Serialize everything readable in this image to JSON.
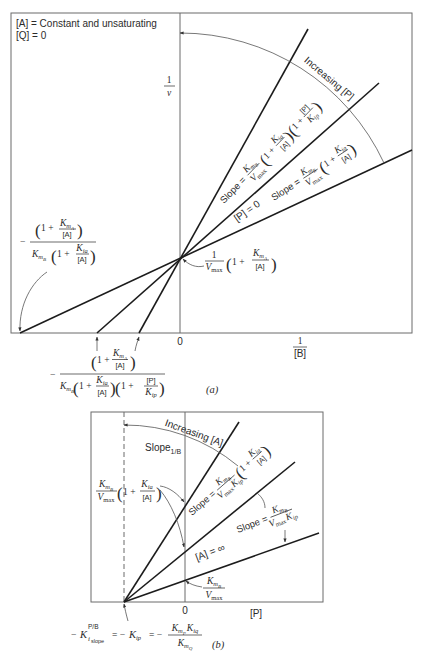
{
  "math_tokens": {
    "lp": "(",
    "rp": ")",
    "one_plus": "1 +",
    "minus": "−",
    "eq_minus": "= −",
    "K": "K",
    "V": "V",
    "m": "m",
    "max": "max",
    "A": "A",
    "B": "B",
    "P": "P",
    "Q": "Q",
    "ia": "ia",
    "ip": "ip",
    "iq": "iq",
    "conc_A": "[A]",
    "conc_P": "[P]",
    "one": "1",
    "slope_eq": "Slope ="
  },
  "panel_a": {
    "tag": "(a)",
    "conditions": [
      "[A] = Constant and unsaturating",
      "[Q] = 0"
    ],
    "y_axis": {
      "num": "1",
      "den": "v"
    },
    "x_axis": {
      "num": "1",
      "den": "[B]",
      "origin": "0"
    },
    "arc_label": "Increasing [P]",
    "line_label": "[P] = 0"
  },
  "panel_b": {
    "tag": "(b)",
    "x_axis": {
      "label": "[P]",
      "origin": "0"
    },
    "arc_label": "Increasing [A]",
    "slope_label": {
      "word": "Slope",
      "sub": "1/B"
    },
    "line_label": "[A] = ∞",
    "ki_formula": {
      "sup": "P/B",
      "sub": "i",
      "subsub": "slope"
    }
  },
  "chart_data": [
    {
      "panel": "(a)",
      "type": "line",
      "title": "",
      "xlabel": "1/[B]",
      "ylabel": "1/v",
      "xlim": [
        -1.69,
        2.32
      ],
      "ylim": [
        0,
        3.2
      ],
      "grid": false,
      "legend": null,
      "conditions": [
        "[A] = Constant and unsaturating",
        "[Q] = 0"
      ],
      "series": [
        {
          "name": "[P] = 0",
          "slope_label": "Slope = (K_mB/Vmax)(1 + K_ia/[A])",
          "points": [
            [
              -1.6,
              0
            ],
            [
              0,
              0.75
            ],
            [
              2.32,
              1.83
            ]
          ]
        },
        {
          "name": "",
          "slope_label": "Slope = (K_mB/Vmax)(1 + K_ia/[A])(1 + [P]/K_ip)",
          "points": [
            [
              -0.83,
              0
            ],
            [
              0,
              0.75
            ],
            [
              1.99,
              2.5
            ]
          ]
        },
        {
          "name": "",
          "slope_label": "",
          "points": [
            [
              -0.41,
              0
            ],
            [
              0,
              0.75
            ],
            [
              1.28,
              3.04
            ]
          ]
        }
      ],
      "annotations": [
        {
          "text": "Increasing [P]",
          "kind": "arc arrow across lines"
        },
        {
          "text": "1/Vmax (1 + K_mA/[A])",
          "at": "common y-intercept"
        },
        {
          "text": "−(1 + K_mA/[A]) / [K_mB (1 + K_ia/[A])]",
          "at": "x-intercept of [P] = 0 line"
        },
        {
          "text": "−(1 + K_mA/[A]) / [K_mB (1 + K_ia/[A])(1 + [P]/K_ip)]",
          "at": "x-intercepts of other lines"
        },
        {
          "text": "0",
          "at": "origin"
        }
      ]
    },
    {
      "panel": "(b)",
      "type": "line",
      "title": "",
      "xlabel": "[P]",
      "ylabel": "Slope_1/B",
      "xlim": [
        -0.94,
        1.38
      ],
      "ylim": [
        0,
        1.9
      ],
      "grid": false,
      "legend": null,
      "series": [
        {
          "name": "[A] = ∞",
          "slope_label": "Slope = K_mB/(Vmax K_ip)",
          "points": [
            [
              -0.61,
              0
            ],
            [
              0,
              0.22
            ],
            [
              1.34,
              0.69
            ]
          ]
        },
        {
          "name": "",
          "slope_label": "Slope = K_mB/(Vmax K_ip) (1 + K_ia/[A])",
          "points": [
            [
              -0.61,
              0
            ],
            [
              0,
              0.51
            ],
            [
              1.1,
              1.4
            ]
          ]
        },
        {
          "name": "",
          "slope_label": "",
          "points": [
            [
              -0.61,
              0
            ],
            [
              0,
              0.97
            ],
            [
              0.54,
              1.8
            ]
          ]
        }
      ],
      "annotations": [
        {
          "text": "Increasing [A]",
          "kind": "arc arrow across lines"
        },
        {
          "text": "(K_mB/Vmax)(1 + K_ia/[A])",
          "at": "y-intercepts"
        },
        {
          "text": "K_mB/Vmax",
          "at": "y-intercept of [A] = ∞ line"
        },
        {
          "text": "−K_i,slope^P/B = −K_ip = −K_mP K_iq / K_mQ",
          "at": "common x-intercept (dashed line)"
        },
        {
          "text": "0",
          "at": "origin"
        }
      ]
    }
  ]
}
